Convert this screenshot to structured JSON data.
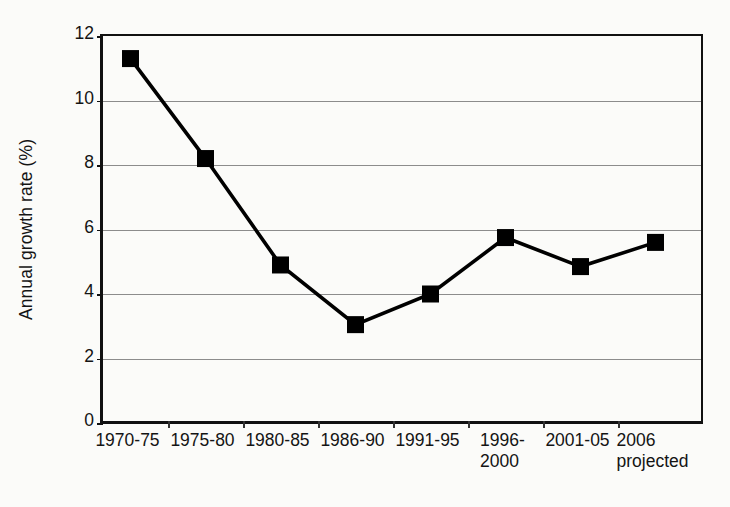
{
  "chart_data": {
    "type": "line",
    "title": "",
    "subtitle": "",
    "xlabel": "",
    "ylabel": "Annual growth rate (%)",
    "categories": [
      "1970-75",
      "1975-80",
      "1980-85",
      "1986-90",
      "1991-95",
      "1996-\n2000",
      "2001-05",
      "2006\nprojected"
    ],
    "values": [
      11.3,
      8.2,
      4.9,
      3.05,
      4.0,
      5.75,
      4.85,
      5.6
    ],
    "series": [
      {
        "name": "Annual growth rate",
        "values": [
          11.3,
          8.2,
          4.9,
          3.05,
          4.0,
          5.75,
          4.85,
          5.6
        ],
        "marker": "filled-square",
        "color": "#000000"
      }
    ],
    "ylim": [
      0,
      12
    ],
    "yticks": [
      0,
      2,
      4,
      6,
      8,
      10,
      12
    ],
    "ytick_labels": [
      "0",
      "2",
      "4",
      "6",
      "8",
      "10",
      "12"
    ],
    "grid": true,
    "grid_axis": "y",
    "legend": false,
    "legend_position": "none",
    "line_color": "#000000",
    "marker_color": "#000000",
    "grid_color": "#8c8c8c",
    "axis_color": "#111111",
    "background_color": "#fbfbf9"
  }
}
